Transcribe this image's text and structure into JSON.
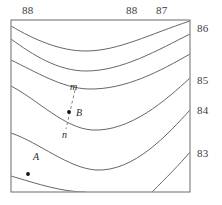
{
  "figure": {
    "plot_area": {
      "x": 11,
      "y": 20,
      "width": 179,
      "height": 172
    },
    "border_color": "#6b6b6b",
    "contour_color": "#555555",
    "dash_color": "#777777",
    "point_color": "#111111",
    "background": "#ffffff"
  },
  "top_labels": [
    {
      "text": "88",
      "x": 22,
      "y": 5
    },
    {
      "text": "88",
      "x": 126,
      "y": 5
    },
    {
      "text": "87",
      "x": 156,
      "y": 5
    }
  ],
  "right_labels": [
    {
      "text": "86",
      "x": 197,
      "y": 23
    },
    {
      "text": "85",
      "x": 197,
      "y": 75
    },
    {
      "text": "84",
      "x": 197,
      "y": 105
    },
    {
      "text": "83",
      "x": 197,
      "y": 148
    }
  ],
  "annotations": [
    {
      "name": "m",
      "text": "m",
      "x": 70,
      "y": 82
    },
    {
      "name": "B",
      "text": "B",
      "x": 76,
      "y": 108
    },
    {
      "name": "n",
      "text": "n",
      "x": 62,
      "y": 130
    },
    {
      "name": "A",
      "text": "A",
      "x": 33,
      "y": 152
    }
  ],
  "points": [
    {
      "name": "point-B",
      "cx": 69,
      "cy": 112,
      "r": 1.9
    },
    {
      "name": "point-A",
      "cx": 28,
      "cy": 174,
      "r": 1.9
    }
  ],
  "dashed_segment": {
    "name": "segment-mn",
    "x1": 75,
    "y1": 90,
    "x2": 66,
    "y2": 129,
    "dasharray": "3,2.5"
  },
  "chart_data": {
    "type": "line",
    "xlabel": "",
    "ylabel": "",
    "grid": false,
    "legend": false,
    "contour_labels_top": [
      "88",
      "88",
      "87"
    ],
    "contour_labels_right": [
      "86",
      "85",
      "84",
      "83"
    ],
    "contour_values": [
      88,
      88,
      87,
      86,
      85,
      84,
      83
    ],
    "series": [
      {
        "name": "contour-88-upper",
        "value": 88,
        "path": "M 11,26 C 35,40 60,51 86,51 C 118,51 150,34 190,21"
      },
      {
        "name": "contour-88-lower",
        "value": 88,
        "path": "M 11,39 C 33,55 58,71 86,71 C 122,71 158,50 190,34"
      },
      {
        "name": "contour-87",
        "value": 87,
        "path": "M 11,60 C 36,72 62,88 88,89 C 126,90 162,70 190,54"
      },
      {
        "name": "contour-86",
        "value": 86,
        "path": "M 11,86 C 38,100 64,128 92,130 C 130,132 166,100 190,78"
      },
      {
        "name": "contour-85",
        "value": 85,
        "path": "M 11,133 C 40,143 68,168 96,170 C 134,172 168,134 190,110"
      },
      {
        "name": "contour-84",
        "value": 84,
        "path": "M 11,176 C 38,184 62,192 86,192"
      },
      {
        "name": "contour-83",
        "value": 83,
        "path": "M 152,192 C 166,178 180,164 190,152"
      }
    ],
    "annotated_points": [
      {
        "label": "A",
        "x": 28,
        "y": 174
      },
      {
        "label": "B",
        "x": 69,
        "y": 112
      }
    ],
    "annotated_segment": {
      "from": "m",
      "to": "n",
      "through": "B"
    }
  }
}
